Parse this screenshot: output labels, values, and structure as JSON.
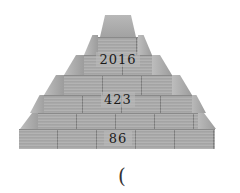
{
  "figure": {
    "type": "stepped-pyramid",
    "levels": [
      {
        "index": 0,
        "label": "2016"
      },
      {
        "index": 1,
        "label": "423"
      },
      {
        "index": 2,
        "label": "86"
      }
    ],
    "answer_blank": "(",
    "colors": {
      "stone": "#a9a9a9",
      "text": "#1a1a1a",
      "background": "#ffffff"
    }
  }
}
